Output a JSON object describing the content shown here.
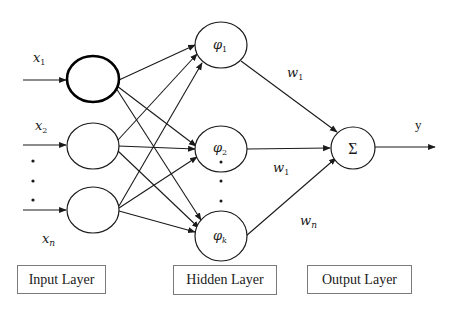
{
  "diagram": {
    "inputs": [
      {
        "label": "x",
        "sub": "1"
      },
      {
        "label": "x",
        "sub": "2"
      },
      {
        "label": "x",
        "sub": "n"
      }
    ],
    "hidden": [
      {
        "label": "φ",
        "sub": "1"
      },
      {
        "label": "φ",
        "sub": "2"
      },
      {
        "label": "φ",
        "sub": "k"
      }
    ],
    "weights": [
      {
        "label": "w",
        "sub": "1"
      },
      {
        "label": "w",
        "sub": "1"
      },
      {
        "label": "w",
        "sub": "n"
      }
    ],
    "output_node": {
      "label": "Σ"
    },
    "output": {
      "label": "y"
    },
    "layers": [
      {
        "label": "Input Layer"
      },
      {
        "label": "Hidden Layer"
      },
      {
        "label": "Output Layer"
      }
    ],
    "colors": {
      "stroke": "#1a1a1a",
      "box_border": "#7a7a7a",
      "background": "#ffffff"
    }
  }
}
